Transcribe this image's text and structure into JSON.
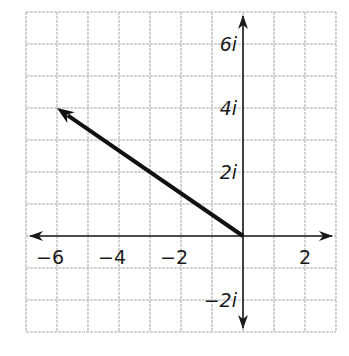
{
  "chart_data": {
    "type": "vector-plot",
    "title": "",
    "xlabel": "",
    "ylabel": "",
    "plane": "complex",
    "xlim": [
      -7,
      3
    ],
    "ylim": [
      -3,
      7
    ],
    "grid": true,
    "grid_step": 1,
    "x_ticks": [
      {
        "value": -6,
        "label": "−6"
      },
      {
        "value": -4,
        "label": "−4"
      },
      {
        "value": -2,
        "label": "−2"
      },
      {
        "value": 2,
        "label": "2"
      }
    ],
    "y_ticks": [
      {
        "value": 6,
        "label": "6i"
      },
      {
        "value": 4,
        "label": "4i"
      },
      {
        "value": 2,
        "label": "2i"
      },
      {
        "value": -2,
        "label": "−2i"
      }
    ],
    "vectors": [
      {
        "from": [
          0,
          0
        ],
        "to": [
          -6,
          4
        ],
        "label": "-6 + 4i"
      }
    ],
    "colors": {
      "grid": "#c8c8c8",
      "axes": "#1a1a1a",
      "vector": "#111111"
    }
  }
}
